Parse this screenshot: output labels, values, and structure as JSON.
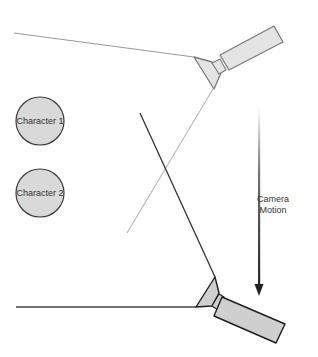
{
  "diagram": {
    "characters": [
      {
        "label": "Character 1",
        "cx": 40,
        "cy": 121,
        "r": 24
      },
      {
        "label": "Character 2",
        "cx": 40,
        "cy": 193,
        "r": 24
      }
    ],
    "motion_label_line1": "Camera",
    "motion_label_line2": "Motion",
    "colors": {
      "character_fill": "#d9d9d9",
      "character_stroke": "#3a3a3a",
      "camera_top_fill": "#e4e4e4",
      "camera_top_stroke": "#7a7a7a",
      "camera_bottom_fill": "#cfcfcf",
      "camera_bottom_stroke": "#1e1e1e",
      "top_view_line": "#9a9a9a",
      "bottom_view_line": "#333333",
      "arrow": "#333333"
    }
  }
}
